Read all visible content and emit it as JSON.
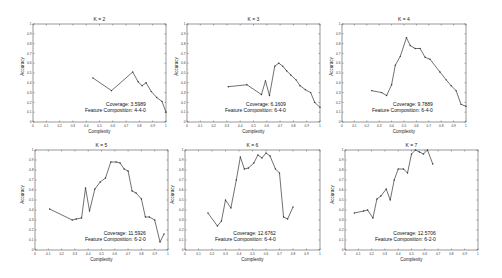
{
  "figure": {
    "panels_per_row": 3,
    "line_color": "#333333",
    "marker_color": "#333333",
    "axis_color": "#555555"
  },
  "chart_data": [
    {
      "type": "line",
      "title": "K = 2",
      "xlabel": "Complexity",
      "ylabel": "Accuracy",
      "xlim": [
        0,
        1
      ],
      "ylim": [
        0,
        1
      ],
      "xticks": [
        "0",
        "0.1",
        "0.2",
        "0.3",
        "0.4",
        "0.5",
        "0.6",
        "0.7",
        "0.8",
        "0.9",
        "1"
      ],
      "yticks": [
        "0",
        "0.1",
        "0.2",
        "0.3",
        "0.4",
        "0.5",
        "0.6",
        "0.7",
        "0.8",
        "0.9",
        "1"
      ],
      "grid": false,
      "annotations": [
        "Coverage: 3.5989",
        "Feature Composition: 4-4-0"
      ],
      "coverage_label": "Coverage: 3.5989",
      "composition_label": "Feature Composition: 4-4-0",
      "x": [
        0.45,
        0.59,
        0.75,
        0.79,
        0.82,
        0.85,
        0.89,
        0.93,
        0.97,
        1.0
      ],
      "y": [
        0.45,
        0.32,
        0.51,
        0.41,
        0.37,
        0.4,
        0.31,
        0.25,
        0.21,
        0.1
      ]
    },
    {
      "type": "line",
      "title": "K = 3",
      "xlabel": "Complexity",
      "ylabel": "Accuracy",
      "xlim": [
        0,
        1
      ],
      "ylim": [
        0,
        1
      ],
      "xticks": [
        "0",
        "0.1",
        "0.2",
        "0.3",
        "0.4",
        "0.5",
        "0.6",
        "0.7",
        "0.8",
        "0.9",
        "1"
      ],
      "yticks": [
        "0",
        "0.1",
        "0.2",
        "0.3",
        "0.4",
        "0.5",
        "0.6",
        "0.7",
        "0.8",
        "0.9",
        "1"
      ],
      "grid": false,
      "annotations": [
        "Coverage: 6.1609",
        "Feature Composition: 6-4-0"
      ],
      "coverage_label": "Coverage: 6.1609",
      "composition_label": "Feature Composition: 6-4-0",
      "x": [
        0.31,
        0.45,
        0.56,
        0.59,
        0.62,
        0.66,
        0.69,
        0.72,
        0.75,
        0.78,
        0.82,
        0.85,
        0.89,
        0.93,
        0.96,
        1.0
      ],
      "y": [
        0.36,
        0.38,
        0.28,
        0.42,
        0.27,
        0.57,
        0.6,
        0.57,
        0.52,
        0.48,
        0.43,
        0.37,
        0.33,
        0.3,
        0.2,
        0.15
      ]
    },
    {
      "type": "line",
      "title": "K = 4",
      "xlabel": "Complexity",
      "ylabel": "Accuracy",
      "xlim": [
        0,
        1
      ],
      "ylim": [
        0,
        1
      ],
      "xticks": [
        "0",
        "0.1",
        "0.2",
        "0.3",
        "0.4",
        "0.5",
        "0.6",
        "0.7",
        "0.8",
        "0.9",
        "1"
      ],
      "yticks": [
        "0",
        "0.1",
        "0.2",
        "0.3",
        "0.4",
        "0.5",
        "0.6",
        "0.7",
        "0.8",
        "0.9",
        "1"
      ],
      "grid": false,
      "annotations": [
        "Coverage: 9.7889",
        "Feature Composition: 6-4-0"
      ],
      "coverage_label": "Coverage: 9.7889",
      "composition_label": "Feature Composition: 6-4-0",
      "x": [
        0.24,
        0.32,
        0.36,
        0.4,
        0.43,
        0.47,
        0.52,
        0.55,
        0.59,
        0.63,
        0.67,
        0.71,
        0.79,
        0.84,
        0.88,
        0.92,
        0.96,
        1.0
      ],
      "y": [
        0.32,
        0.3,
        0.27,
        0.38,
        0.58,
        0.67,
        0.86,
        0.78,
        0.75,
        0.75,
        0.66,
        0.64,
        0.51,
        0.43,
        0.37,
        0.32,
        0.18,
        0.16
      ]
    },
    {
      "type": "line",
      "title": "K = 5",
      "xlabel": "Complexity",
      "ylabel": "Accuracy",
      "xlim": [
        0,
        1
      ],
      "ylim": [
        0,
        1
      ],
      "xticks": [
        "0",
        "0.1",
        "0.2",
        "0.3",
        "0.4",
        "0.5",
        "0.6",
        "0.7",
        "0.8",
        "0.9",
        "1"
      ],
      "yticks": [
        "0",
        "0.1",
        "0.2",
        "0.3",
        "0.4",
        "0.5",
        "0.6",
        "0.7",
        "0.8",
        "0.9",
        "1"
      ],
      "grid": false,
      "annotations": [
        "Coverage: 11.5926",
        "Feature Composition: 6-2-0"
      ],
      "coverage_label": "Coverage: 11.5926",
      "composition_label": "Feature Composition: 6-2-0",
      "x": [
        0.11,
        0.28,
        0.31,
        0.35,
        0.38,
        0.41,
        0.45,
        0.49,
        0.53,
        0.57,
        0.61,
        0.64,
        0.67,
        0.7,
        0.73,
        0.76,
        0.8,
        0.83,
        0.86,
        0.9,
        0.94,
        0.97
      ],
      "y": [
        0.41,
        0.3,
        0.31,
        0.32,
        0.62,
        0.39,
        0.61,
        0.68,
        0.72,
        0.88,
        0.88,
        0.87,
        0.81,
        0.79,
        0.59,
        0.57,
        0.51,
        0.33,
        0.33,
        0.3,
        0.08,
        0.16
      ]
    },
    {
      "type": "line",
      "title": "K = 6",
      "xlabel": "Complexity",
      "ylabel": "Accuracy",
      "xlim": [
        0,
        1
      ],
      "ylim": [
        0,
        1
      ],
      "xticks": [
        "0",
        "0.1",
        "0.2",
        "0.3",
        "0.4",
        "0.5",
        "0.6",
        "0.7",
        "0.8",
        "0.9",
        "1"
      ],
      "yticks": [
        "0",
        "0.1",
        "0.2",
        "0.3",
        "0.4",
        "0.5",
        "0.6",
        "0.7",
        "0.8",
        "0.9",
        "1"
      ],
      "grid": false,
      "annotations": [
        "Coverage: 12.6762",
        "Feature Composition: 6-4-0"
      ],
      "coverage_label": "Coverage: 12.6762",
      "composition_label": "Feature Composition: 6-4-0",
      "x": [
        0.17,
        0.24,
        0.27,
        0.3,
        0.34,
        0.38,
        0.41,
        0.44,
        0.47,
        0.51,
        0.54,
        0.57,
        0.6,
        0.63,
        0.67,
        0.7,
        0.73,
        0.76,
        0.8
      ],
      "y": [
        0.37,
        0.24,
        0.29,
        0.5,
        0.42,
        0.7,
        0.93,
        0.81,
        0.82,
        0.87,
        0.95,
        0.92,
        0.97,
        0.94,
        0.81,
        0.77,
        0.33,
        0.31,
        0.43
      ]
    },
    {
      "type": "line",
      "title": "K = 7",
      "xlabel": "Complexity",
      "ylabel": "Accuracy",
      "xlim": [
        0,
        1
      ],
      "ylim": [
        0,
        1
      ],
      "xticks": [
        "0",
        "0.1",
        "0.2",
        "0.3",
        "0.4",
        "0.5",
        "0.6",
        "0.7",
        "0.8",
        "0.9",
        "1"
      ],
      "yticks": [
        "0",
        "0.1",
        "0.2",
        "0.3",
        "0.4",
        "0.5",
        "0.6",
        "0.7",
        "0.8",
        "0.9",
        "1"
      ],
      "grid": false,
      "annotations": [
        "Coverage: 12.5706",
        "Feature Composition: 6-2-0"
      ],
      "coverage_label": "Coverage: 12.5706",
      "composition_label": "Feature Composition: 6-2-0",
      "x": [
        0.07,
        0.14,
        0.17,
        0.21,
        0.24,
        0.27,
        0.31,
        0.34,
        0.37,
        0.4,
        0.44,
        0.47,
        0.5,
        0.53,
        0.56,
        0.59,
        0.62,
        0.66
      ],
      "y": [
        0.37,
        0.39,
        0.4,
        0.32,
        0.51,
        0.54,
        0.61,
        0.5,
        0.7,
        0.81,
        0.81,
        0.77,
        0.96,
        1.0,
        0.98,
        0.96,
        1.0,
        0.86
      ]
    }
  ]
}
